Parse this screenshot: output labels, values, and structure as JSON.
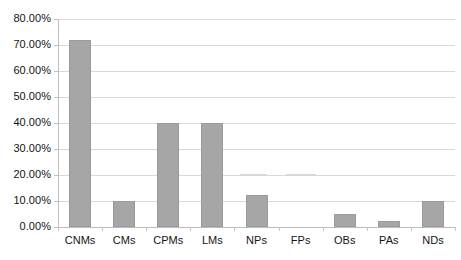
{
  "chart_data": {
    "type": "bar",
    "title": "",
    "subtitle": "",
    "xlabel": "",
    "ylabel": "",
    "categories": [
      "CNMs",
      "CMs",
      "CPMs",
      "LMs",
      "NPs",
      "FPs",
      "OBs",
      "PAs",
      "NDs"
    ],
    "values": [
      72.0,
      10.0,
      40.0,
      40.0,
      12.5,
      0.0,
      5.0,
      2.5,
      10.0
    ],
    "value_labels": [
      "72.00%",
      "10.00%",
      "40.00%",
      "40.00%",
      "12.50%",
      "0.00%",
      "5.00%",
      "2.50%",
      "10.00%"
    ],
    "ylim": [
      0,
      80
    ],
    "ytick_values": [
      0,
      10,
      20,
      30,
      40,
      50,
      60,
      70,
      80
    ],
    "ytick_labels": [
      "0.00%",
      "10.00%",
      "20.00%",
      "30.00%",
      "40.00%",
      "50.00%",
      "60.00%",
      "70.00%",
      "80.00%"
    ],
    "grid": true,
    "grid_axis": "y",
    "legend": false,
    "legend_position": "none",
    "series": [
      {
        "name": "",
        "values": [
          72.0,
          10.0,
          40.0,
          40.0,
          12.5,
          0.0,
          5.0,
          2.5,
          10.0
        ]
      }
    ],
    "colors": {
      "bar_fill": "#a6a6a6",
      "bar_border": "#9b9b9b",
      "gridline": "#d9d9d9",
      "axis": "#bfbfbf",
      "text": "#141414",
      "background": "#ffffff"
    }
  }
}
